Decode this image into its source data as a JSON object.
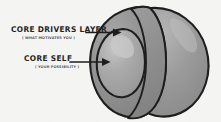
{
  "diagram": {
    "background_color": "#f4f4f2",
    "ink_color": "#1e1e1e",
    "annotations": [
      {
        "id": "core-drivers-layer",
        "title": "CORE DRIVERS LAYER",
        "subtitle": "( WHAT MOTIVATES YOU )",
        "arrow": "right-arrow",
        "target": "outer-shell"
      },
      {
        "id": "core-self",
        "title": "CORE SELF",
        "subtitle": "( YOUR POSSIBILITY )",
        "arrow": "right-arrow",
        "target": "inner-core"
      }
    ],
    "shape": {
      "name": "cutaway-sphere",
      "outer_shell_color": "#8e8e8e",
      "cutaway_face_color": "#9a9a9a",
      "inner_core_color": "#a8a8a8",
      "highlight_color": "#c2c2c2",
      "stroke_color": "#1e1e1e",
      "parts": [
        {
          "name": "outer-shell",
          "label": "CORE DRIVERS LAYER"
        },
        {
          "name": "cutaway-face",
          "label": ""
        },
        {
          "name": "inner-core",
          "label": "CORE SELF"
        },
        {
          "name": "core-highlight",
          "label": ""
        }
      ]
    }
  }
}
